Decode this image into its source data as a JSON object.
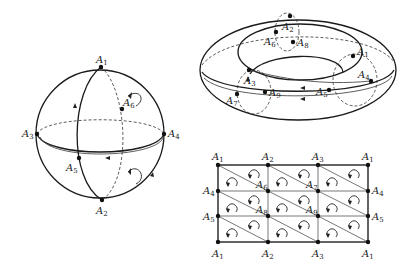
{
  "figure": {
    "sphere": {
      "title": "Triangulated sphere",
      "vertices": [
        {
          "name": "A",
          "sub": "1",
          "x": 101,
          "y": 67,
          "lx": 96,
          "ly": 63
        },
        {
          "name": "A",
          "sub": "2",
          "x": 102,
          "y": 200,
          "lx": 96,
          "ly": 214
        },
        {
          "name": "A",
          "sub": "3",
          "x": 37,
          "y": 134,
          "lx": 22,
          "ly": 137
        },
        {
          "name": "A",
          "sub": "4",
          "x": 164,
          "y": 134,
          "lx": 168,
          "ly": 137
        },
        {
          "name": "A",
          "sub": "5",
          "x": 79,
          "y": 158,
          "lx": 66,
          "ly": 171
        },
        {
          "name": "A",
          "sub": "6",
          "x": 122,
          "y": 109,
          "lx": 123,
          "ly": 106
        }
      ]
    },
    "torus": {
      "title": "Triangulated torus",
      "vertices": [
        {
          "name": "A",
          "sub": "1",
          "x": 353,
          "y": 56,
          "lx": 357,
          "ly": 55
        },
        {
          "name": "A",
          "sub": "2",
          "x": 290,
          "y": 16,
          "lx": 282,
          "ly": 30
        },
        {
          "name": "A",
          "sub": "3",
          "x": 249,
          "y": 70,
          "lx": 244,
          "ly": 84
        },
        {
          "name": "A",
          "sub": "4",
          "x": 371,
          "y": 81,
          "lx": 358,
          "ly": 78
        },
        {
          "name": "A",
          "sub": "5",
          "x": 329,
          "y": 90,
          "lx": 316,
          "ly": 95
        },
        {
          "name": "A",
          "sub": "6",
          "x": 276,
          "y": 32,
          "lx": 264,
          "ly": 45
        },
        {
          "name": "A",
          "sub": "7",
          "x": 237,
          "y": 94,
          "lx": 226,
          "ly": 104
        },
        {
          "name": "A",
          "sub": "8",
          "x": 293,
          "y": 42,
          "lx": 297,
          "ly": 46
        },
        {
          "name": "A",
          "sub": "9",
          "x": 265,
          "y": 92,
          "lx": 269,
          "ly": 96
        }
      ]
    },
    "grid": {
      "title": "Planar triangulation of torus",
      "columns_x": [
        218,
        268,
        318,
        368
      ],
      "rows_y": [
        165,
        191,
        216,
        242
      ],
      "labels": [
        {
          "name": "A",
          "sub": "1",
          "x": 212,
          "y": 160
        },
        {
          "name": "A",
          "sub": "2",
          "x": 262,
          "y": 160
        },
        {
          "name": "A",
          "sub": "3",
          "x": 312,
          "y": 160
        },
        {
          "name": "A",
          "sub": "1",
          "x": 362,
          "y": 160
        },
        {
          "name": "A",
          "sub": "4",
          "x": 203,
          "y": 194
        },
        {
          "name": "A",
          "sub": "6",
          "x": 256,
          "y": 188
        },
        {
          "name": "A",
          "sub": "7",
          "x": 306,
          "y": 188
        },
        {
          "name": "A",
          "sub": "4",
          "x": 372,
          "y": 194
        },
        {
          "name": "A",
          "sub": "5",
          "x": 203,
          "y": 220
        },
        {
          "name": "A",
          "sub": "8",
          "x": 256,
          "y": 213
        },
        {
          "name": "A",
          "sub": "9",
          "x": 306,
          "y": 213
        },
        {
          "name": "A",
          "sub": "5",
          "x": 372,
          "y": 220
        },
        {
          "name": "A",
          "sub": "1",
          "x": 212,
          "y": 257
        },
        {
          "name": "A",
          "sub": "2",
          "x": 262,
          "y": 257
        },
        {
          "name": "A",
          "sub": "3",
          "x": 312,
          "y": 257
        },
        {
          "name": "A",
          "sub": "1",
          "x": 362,
          "y": 257
        }
      ]
    }
  }
}
